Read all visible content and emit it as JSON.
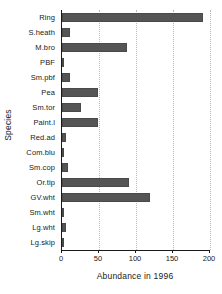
{
  "chart_data": {
    "type": "bar",
    "orientation": "horizontal",
    "title": "",
    "xlabel": "Abundance in 1996",
    "ylabel": "Species",
    "categories": [
      "Ring",
      "S.heath",
      "M.bro",
      "PBF",
      "Sm.pbf",
      "Pea",
      "Sm.tor",
      "Paint.l",
      "Red.ad",
      "Com.blu",
      "Sm.cop",
      "Or.tip",
      "GV.wht",
      "Sm.wht",
      "Lg.wht",
      "Lg.skip"
    ],
    "values": [
      190,
      11,
      88,
      3,
      11,
      48,
      25,
      49,
      5,
      3,
      8,
      90,
      119,
      3,
      5,
      3
    ],
    "xlim": [
      0,
      200
    ],
    "xticks": [
      0,
      50,
      100,
      150,
      200
    ],
    "xtick_labels": [
      "0",
      "50",
      "100",
      "150",
      "200"
    ],
    "grid": "vertical-dotted",
    "legend": "none",
    "bar_color": "#555555",
    "bar_edge_color": "#4a4a4a",
    "axis_color": "#1a1a1a",
    "gridline_color": "#b8b8b8",
    "background": "#ffffff"
  }
}
